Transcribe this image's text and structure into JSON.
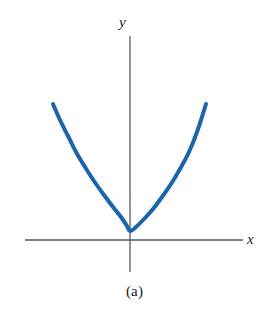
{
  "figure": {
    "caption": "(a)",
    "background_color": "#ffffff"
  },
  "axes": {
    "x_label": "x",
    "y_label": "y",
    "axis_color": "#58585a",
    "x_axis": {
      "x1": 25,
      "y1": 240,
      "x2": 243,
      "y2": 240
    },
    "y_axis": {
      "x1": 130,
      "y1": 36,
      "x2": 130,
      "y2": 272
    },
    "origin": {
      "x": 130,
      "y": 240
    }
  },
  "chart_data": {
    "type": "line",
    "title": "(a)",
    "xlabel": "x",
    "ylabel": "y",
    "grid": false,
    "legend": null,
    "axis_style": "cartesian-cross-no-ticks",
    "curve_color": "#1c64ad",
    "curve_width_px": 4,
    "equation": "y = x^2",
    "xlim": [
      -1.05,
      0.95
    ],
    "ylim": [
      -0.2,
      1.4
    ],
    "x": [
      -1.0,
      -0.9,
      -0.8,
      -0.7,
      -0.6,
      -0.5,
      -0.4,
      -0.3,
      -0.2,
      -0.1,
      0.0,
      0.1,
      0.2,
      0.3,
      0.4,
      0.5,
      0.6,
      0.7,
      0.8,
      0.9
    ],
    "values": [
      1.18,
      1.0,
      0.84,
      0.68,
      0.54,
      0.4,
      0.28,
      0.18,
      0.1,
      0.04,
      0.02,
      0.04,
      0.1,
      0.18,
      0.28,
      0.4,
      0.54,
      0.68,
      0.84,
      1.18
    ],
    "pixel_points": [
      [
        53,
        104
      ],
      [
        60,
        120
      ],
      [
        68,
        136
      ],
      [
        76,
        152
      ],
      [
        85,
        167
      ],
      [
        94,
        181
      ],
      [
        104,
        195
      ],
      [
        113,
        207
      ],
      [
        121,
        217
      ],
      [
        127,
        226
      ],
      [
        130,
        231
      ],
      [
        136,
        227
      ],
      [
        144,
        219
      ],
      [
        153,
        209
      ],
      [
        162,
        197
      ],
      [
        171,
        184
      ],
      [
        180,
        169
      ],
      [
        189,
        152
      ],
      [
        197,
        132
      ],
      [
        206,
        104
      ]
    ],
    "endpoints": {
      "left": [
        53,
        104
      ],
      "right": [
        206,
        104
      ]
    },
    "vertex_pixel": [
      130,
      231
    ]
  }
}
